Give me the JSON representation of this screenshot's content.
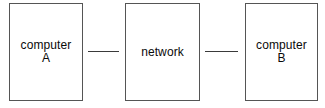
{
  "diagram": {
    "type": "network-topology",
    "background_color": "#ffffff",
    "border_color": "#555555",
    "link_color": "#3a3a3a",
    "text_color": "#0a0a0a",
    "nodes": [
      {
        "id": "computer-a",
        "line1": "computer",
        "line2": "A"
      },
      {
        "id": "network",
        "line1": "network",
        "line2": ""
      },
      {
        "id": "computer-b",
        "line1": "computer",
        "line2": "B"
      }
    ],
    "links": [
      {
        "id": "link-a-network",
        "from": "computer-a",
        "to": "network"
      },
      {
        "id": "link-network-b",
        "from": "network",
        "to": "computer-b"
      }
    ]
  }
}
